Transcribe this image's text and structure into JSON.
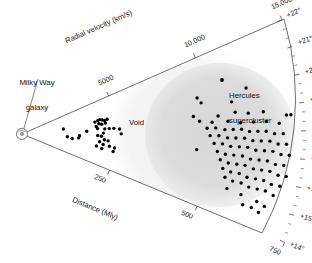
{
  "figure": {
    "kind": "wedge-sky-survey",
    "background": "#ffffff",
    "ink": "#1a1a1a",
    "dot_color": "#000000",
    "blob_color": "#d8d8d8",
    "halo_color": "#eeeeee"
  },
  "annotations": {
    "milky_way_line1": "Milky Way",
    "milky_way_line2": "galaxy",
    "void": "Void",
    "hercules_line1": "Hercules",
    "hercules_line2": "supercluster"
  },
  "chart_data": {
    "type": "scatter",
    "title": "",
    "projection": "polar-wedge",
    "grid": false,
    "legend": null,
    "axes": {
      "radial_velocity": {
        "label": "Radial velocity (km/s)",
        "position": "upper-edge",
        "ticks": [
          5000,
          10000,
          15000
        ],
        "tick_labels": [
          "5000",
          "10,000",
          "15,000"
        ],
        "range": [
          0,
          15000
        ]
      },
      "distance": {
        "label": "Distance (Mly)",
        "position": "lower-edge",
        "ticks": [
          250,
          500,
          750
        ],
        "tick_labels": [
          "250",
          "500",
          "750"
        ],
        "range": [
          0,
          750
        ]
      },
      "declination": {
        "label": "",
        "position": "right-arc",
        "ticks": [
          14,
          15,
          16,
          17,
          18,
          19,
          20,
          21,
          22
        ],
        "tick_labels": [
          "+14°",
          "+15°",
          "+16°",
          "+17°",
          "+18°",
          "+19°",
          "+20°",
          "+21°",
          "+22°"
        ],
        "minor_ticks_per_interval": 2,
        "range": [
          14,
          22
        ]
      }
    },
    "regions": [
      {
        "name": "void",
        "label": "Void",
        "distance_range": [
          330,
          430
        ],
        "shading": "none"
      },
      {
        "name": "hercules-supercluster",
        "label": "Hercules supercluster",
        "distance_range": [
          440,
          760
        ],
        "shading": "gray-blob"
      }
    ],
    "marker": {
      "shape": "circle",
      "size_px": 3.4,
      "color": "#000000"
    },
    "points_note": "Each point is one galaxy; coordinates are (distance in Mly, declination in degrees).",
    "points": [
      [
        110,
        19.1
      ],
      [
        120,
        17.3
      ],
      [
        133,
        17.0
      ],
      [
        150,
        17.2
      ],
      [
        152,
        17.6
      ],
      [
        195,
        19.5
      ],
      [
        203,
        19.6
      ],
      [
        209,
        19.7
      ],
      [
        215,
        19.6
      ],
      [
        221,
        19.5
      ],
      [
        228,
        19.6
      ],
      [
        205,
        19.2
      ],
      [
        212,
        19.1
      ],
      [
        222,
        19.2
      ],
      [
        197,
        18.9
      ],
      [
        200,
        18.6
      ],
      [
        219,
        18.5
      ],
      [
        231,
        18.5
      ],
      [
        243,
        18.5
      ],
      [
        258,
        18.4
      ],
      [
        171,
        18.3
      ],
      [
        215,
        18.0
      ],
      [
        262,
        17.9
      ],
      [
        200,
        17.7
      ],
      [
        210,
        17.6
      ],
      [
        218,
        17.2
      ],
      [
        228,
        17.1
      ],
      [
        206,
        16.9
      ],
      [
        216,
        16.6
      ],
      [
        233,
        16.5
      ],
      [
        247,
        16.4
      ],
      [
        199,
        16.3
      ],
      [
        214,
        16.1
      ],
      [
        245,
        16.0
      ],
      [
        472,
        19.9
      ],
      [
        480,
        19.6
      ],
      [
        560,
        19.4
      ],
      [
        604,
        19.9
      ],
      [
        455,
        18.9
      ],
      [
        520,
        18.8
      ],
      [
        566,
        18.9
      ],
      [
        600,
        18.8
      ],
      [
        640,
        18.8
      ],
      [
        700,
        18.6
      ],
      [
        712,
        18.6
      ],
      [
        470,
        18.6
      ],
      [
        503,
        18.5
      ],
      [
        545,
        18.5
      ],
      [
        578,
        18.4
      ],
      [
        612,
        18.4
      ],
      [
        646,
        18.4
      ],
      [
        680,
        18.3
      ],
      [
        489,
        18.2
      ],
      [
        512,
        18.2
      ],
      [
        536,
        18.1
      ],
      [
        558,
        18.1
      ],
      [
        580,
        18.1
      ],
      [
        601,
        18.0
      ],
      [
        623,
        18.0
      ],
      [
        645,
        18.0
      ],
      [
        667,
        17.9
      ],
      [
        690,
        17.9
      ],
      [
        497,
        17.8
      ],
      [
        520,
        17.8
      ],
      [
        543,
        17.7
      ],
      [
        565,
        17.7
      ],
      [
        588,
        17.7
      ],
      [
        610,
        17.6
      ],
      [
        632,
        17.6
      ],
      [
        655,
        17.6
      ],
      [
        677,
        17.5
      ],
      [
        699,
        17.5
      ],
      [
        508,
        17.4
      ],
      [
        530,
        17.4
      ],
      [
        552,
        17.3
      ],
      [
        575,
        17.3
      ],
      [
        597,
        17.3
      ],
      [
        619,
        17.2
      ],
      [
        642,
        17.2
      ],
      [
        664,
        17.2
      ],
      [
        686,
        17.1
      ],
      [
        708,
        17.1
      ],
      [
        463,
        17.0
      ],
      [
        518,
        17.0
      ],
      [
        540,
        16.9
      ],
      [
        562,
        16.9
      ],
      [
        585,
        16.9
      ],
      [
        607,
        16.8
      ],
      [
        630,
        16.8
      ],
      [
        652,
        16.8
      ],
      [
        674,
        16.7
      ],
      [
        696,
        16.7
      ],
      [
        528,
        16.6
      ],
      [
        550,
        16.5
      ],
      [
        573,
        16.5
      ],
      [
        595,
        16.5
      ],
      [
        618,
        16.4
      ],
      [
        640,
        16.4
      ],
      [
        662,
        16.4
      ],
      [
        685,
        16.3
      ],
      [
        707,
        16.3
      ],
      [
        538,
        16.2
      ],
      [
        560,
        16.1
      ],
      [
        583,
        16.1
      ],
      [
        605,
        16.0
      ],
      [
        628,
        16.0
      ],
      [
        650,
        16.0
      ],
      [
        672,
        15.9
      ],
      [
        695,
        15.9
      ],
      [
        548,
        15.8
      ],
      [
        570,
        15.7
      ],
      [
        593,
        15.7
      ],
      [
        615,
        15.6
      ],
      [
        638,
        15.6
      ],
      [
        660,
        15.6
      ],
      [
        683,
        15.5
      ],
      [
        560,
        15.3
      ],
      [
        600,
        15.2
      ],
      [
        645,
        15.1
      ],
      [
        668,
        15.0
      ],
      [
        612,
        14.8
      ],
      [
        636,
        14.8
      ],
      [
        658,
        14.7
      ]
    ]
  }
}
